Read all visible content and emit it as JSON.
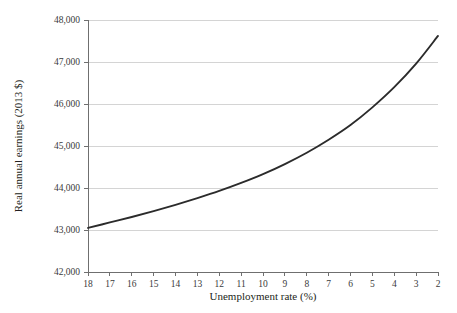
{
  "chart_data": {
    "type": "line",
    "title": "",
    "subtitle": "",
    "xlabel": "Unemployment rate (%)",
    "ylabel": "Real annual earnings (2013 $)",
    "xlim": [
      18,
      2
    ],
    "ylim": [
      42000,
      48000
    ],
    "x_axis_reversed": true,
    "grid": "horizontal",
    "legend": "none",
    "line_color": "#2b2b2b",
    "grid_color": "#c9c9c9",
    "axis_color": "#6f6f6f",
    "xticks": [
      18,
      17,
      16,
      15,
      14,
      13,
      12,
      11,
      10,
      9,
      8,
      7,
      6,
      5,
      4,
      3,
      2
    ],
    "xtick_labels": [
      "18",
      "17",
      "16",
      "15",
      "14",
      "13",
      "12",
      "11",
      "10",
      "9",
      "8",
      "7",
      "6",
      "5",
      "4",
      "3",
      "2"
    ],
    "yticks": [
      42000,
      43000,
      44000,
      45000,
      46000,
      47000,
      48000
    ],
    "ytick_labels": [
      "42,000",
      "43,000",
      "44,000",
      "45,000",
      "46,000",
      "47,000",
      "48,000"
    ],
    "x": [
      18,
      17,
      16,
      15,
      14,
      13,
      12,
      11,
      10,
      9,
      8,
      7,
      6,
      5,
      4,
      3,
      2
    ],
    "values": [
      43050,
      43180,
      43310,
      43450,
      43600,
      43760,
      43930,
      44120,
      44330,
      44570,
      44840,
      45150,
      45500,
      45920,
      46400,
      46960,
      47620
    ],
    "series": [
      {
        "name": "Real annual earnings",
        "x": [
          18,
          17,
          16,
          15,
          14,
          13,
          12,
          11,
          10,
          9,
          8,
          7,
          6,
          5,
          4,
          3,
          2
        ],
        "values": [
          43050,
          43180,
          43310,
          43450,
          43600,
          43760,
          43930,
          44120,
          44330,
          44570,
          44840,
          45150,
          45500,
          45920,
          46400,
          46960,
          47620
        ]
      }
    ],
    "annotations": []
  }
}
